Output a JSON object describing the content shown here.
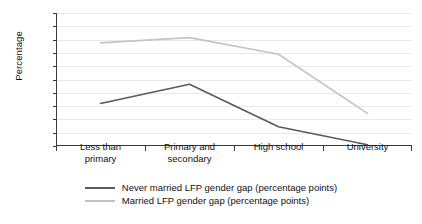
{
  "chart_data": {
    "type": "line",
    "title": "",
    "xlabel": "",
    "ylabel": "Percentage",
    "ylim": [
      0,
      100
    ],
    "yticks": [
      0,
      10,
      20,
      30,
      40,
      50,
      60,
      70,
      80,
      90,
      100
    ],
    "grid": true,
    "legend_position": "bottom",
    "categories": [
      "Less than primary",
      "Primary and secondary",
      "High school",
      "University"
    ],
    "category_lines": [
      [
        "Less than",
        "primary"
      ],
      [
        "Primary and",
        "secondary"
      ],
      [
        "High school",
        ""
      ],
      [
        "University",
        ""
      ]
    ],
    "series": [
      {
        "name": "Never married LFP gender gap (percentage points)",
        "color": "#5a5a5a",
        "values": [
          32,
          46.5,
          14.5,
          1
        ]
      },
      {
        "name": "Married LFP gender gap (percentage points)",
        "color": "#c4c4c4",
        "values": [
          77.5,
          81.5,
          69,
          24.5
        ]
      }
    ]
  },
  "axis": {
    "y_title": "Percentage",
    "tick_labels": [
      "100",
      "90",
      "80",
      "70",
      "60",
      "50",
      "40",
      "30",
      "20",
      "10",
      "0"
    ]
  },
  "legend": {
    "items": [
      {
        "label": "Never married LFP gender gap (percentage points)",
        "color": "#5a5a5a"
      },
      {
        "label": "Married LFP gender gap (percentage points)",
        "color": "#c4c4c4"
      }
    ]
  },
  "colors": {
    "never_married": "#5a5a5a",
    "married": "#c4c4c4",
    "axis": "#3a3a3a",
    "grid": "#e9e9e9",
    "background": "#ffffff"
  }
}
